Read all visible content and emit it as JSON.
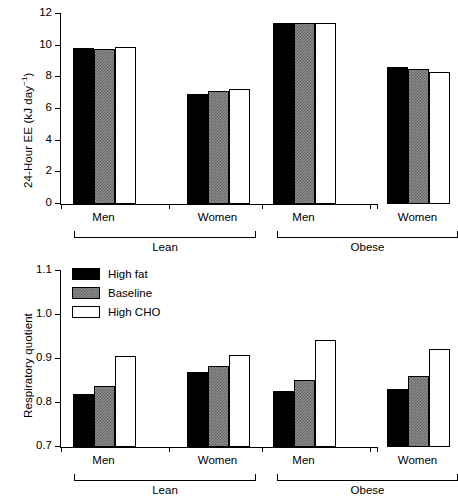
{
  "figure": {
    "background": "#ffffff",
    "ink": "#000000"
  },
  "legend": {
    "position": "upper-left-of-bottom-panel",
    "entries": [
      {
        "label": "High fat",
        "fill": "black",
        "color": "#000000"
      },
      {
        "label": "Baseline",
        "fill": "gray",
        "color": "#8d8d8d"
      },
      {
        "label": "High CHO",
        "fill": "white",
        "color": "#ffffff"
      }
    ]
  },
  "groups": {
    "subgroup_labels": [
      "Men",
      "Women",
      "Men",
      "Women"
    ],
    "brackets": [
      {
        "label": "Lean",
        "covers": [
          "Men",
          "Women"
        ]
      },
      {
        "label": "Obese",
        "covers": [
          "Men",
          "Women"
        ]
      }
    ]
  },
  "chart_data": [
    {
      "id": "panel-top",
      "type": "bar",
      "title": "",
      "xlabel": "",
      "ylabel": "24-Hour EE (kJ day⁻¹)",
      "ylabel_main": "24-Hour EE (kJ day",
      "ylabel_sup": "−1",
      "ylabel_tail": ")",
      "ylim": [
        0,
        12
      ],
      "yticks": [
        0,
        2,
        4,
        6,
        8,
        10,
        12
      ],
      "ytick_labels": [
        "0",
        "2",
        "4",
        "6",
        "8",
        "10",
        "12"
      ],
      "grid": false,
      "categories": [
        "Men",
        "Women",
        "Men",
        "Women"
      ],
      "category_groups": [
        "Lean",
        "Lean",
        "Obese",
        "Obese"
      ],
      "series": [
        {
          "name": "High fat",
          "fill": "black",
          "values": [
            9.85,
            6.95,
            11.45,
            8.65
          ]
        },
        {
          "name": "Baseline",
          "fill": "gray",
          "values": [
            9.8,
            7.15,
            11.45,
            8.5
          ]
        },
        {
          "name": "High CHO",
          "fill": "white",
          "values": [
            9.92,
            7.28,
            11.45,
            8.32
          ]
        }
      ]
    },
    {
      "id": "panel-bottom",
      "type": "bar",
      "title": "",
      "xlabel": "",
      "ylabel": "Respiratory quotient",
      "ylim": [
        0.7,
        1.1
      ],
      "yticks": [
        0.7,
        0.8,
        0.9,
        1.0,
        1.1
      ],
      "ytick_labels": [
        "0.7",
        "0.8",
        "0.9",
        "1.0",
        "1.1"
      ],
      "grid": false,
      "categories": [
        "Men",
        "Women",
        "Men",
        "Women"
      ],
      "category_groups": [
        "Lean",
        "Lean",
        "Obese",
        "Obese"
      ],
      "series": [
        {
          "name": "High fat",
          "fill": "black",
          "values": [
            0.82,
            0.87,
            0.828,
            0.831
          ]
        },
        {
          "name": "Baseline",
          "fill": "gray",
          "values": [
            0.838,
            0.884,
            0.853,
            0.861
          ]
        },
        {
          "name": "High CHO",
          "fill": "white",
          "values": [
            0.906,
            0.91,
            0.943,
            0.923
          ]
        }
      ]
    }
  ]
}
